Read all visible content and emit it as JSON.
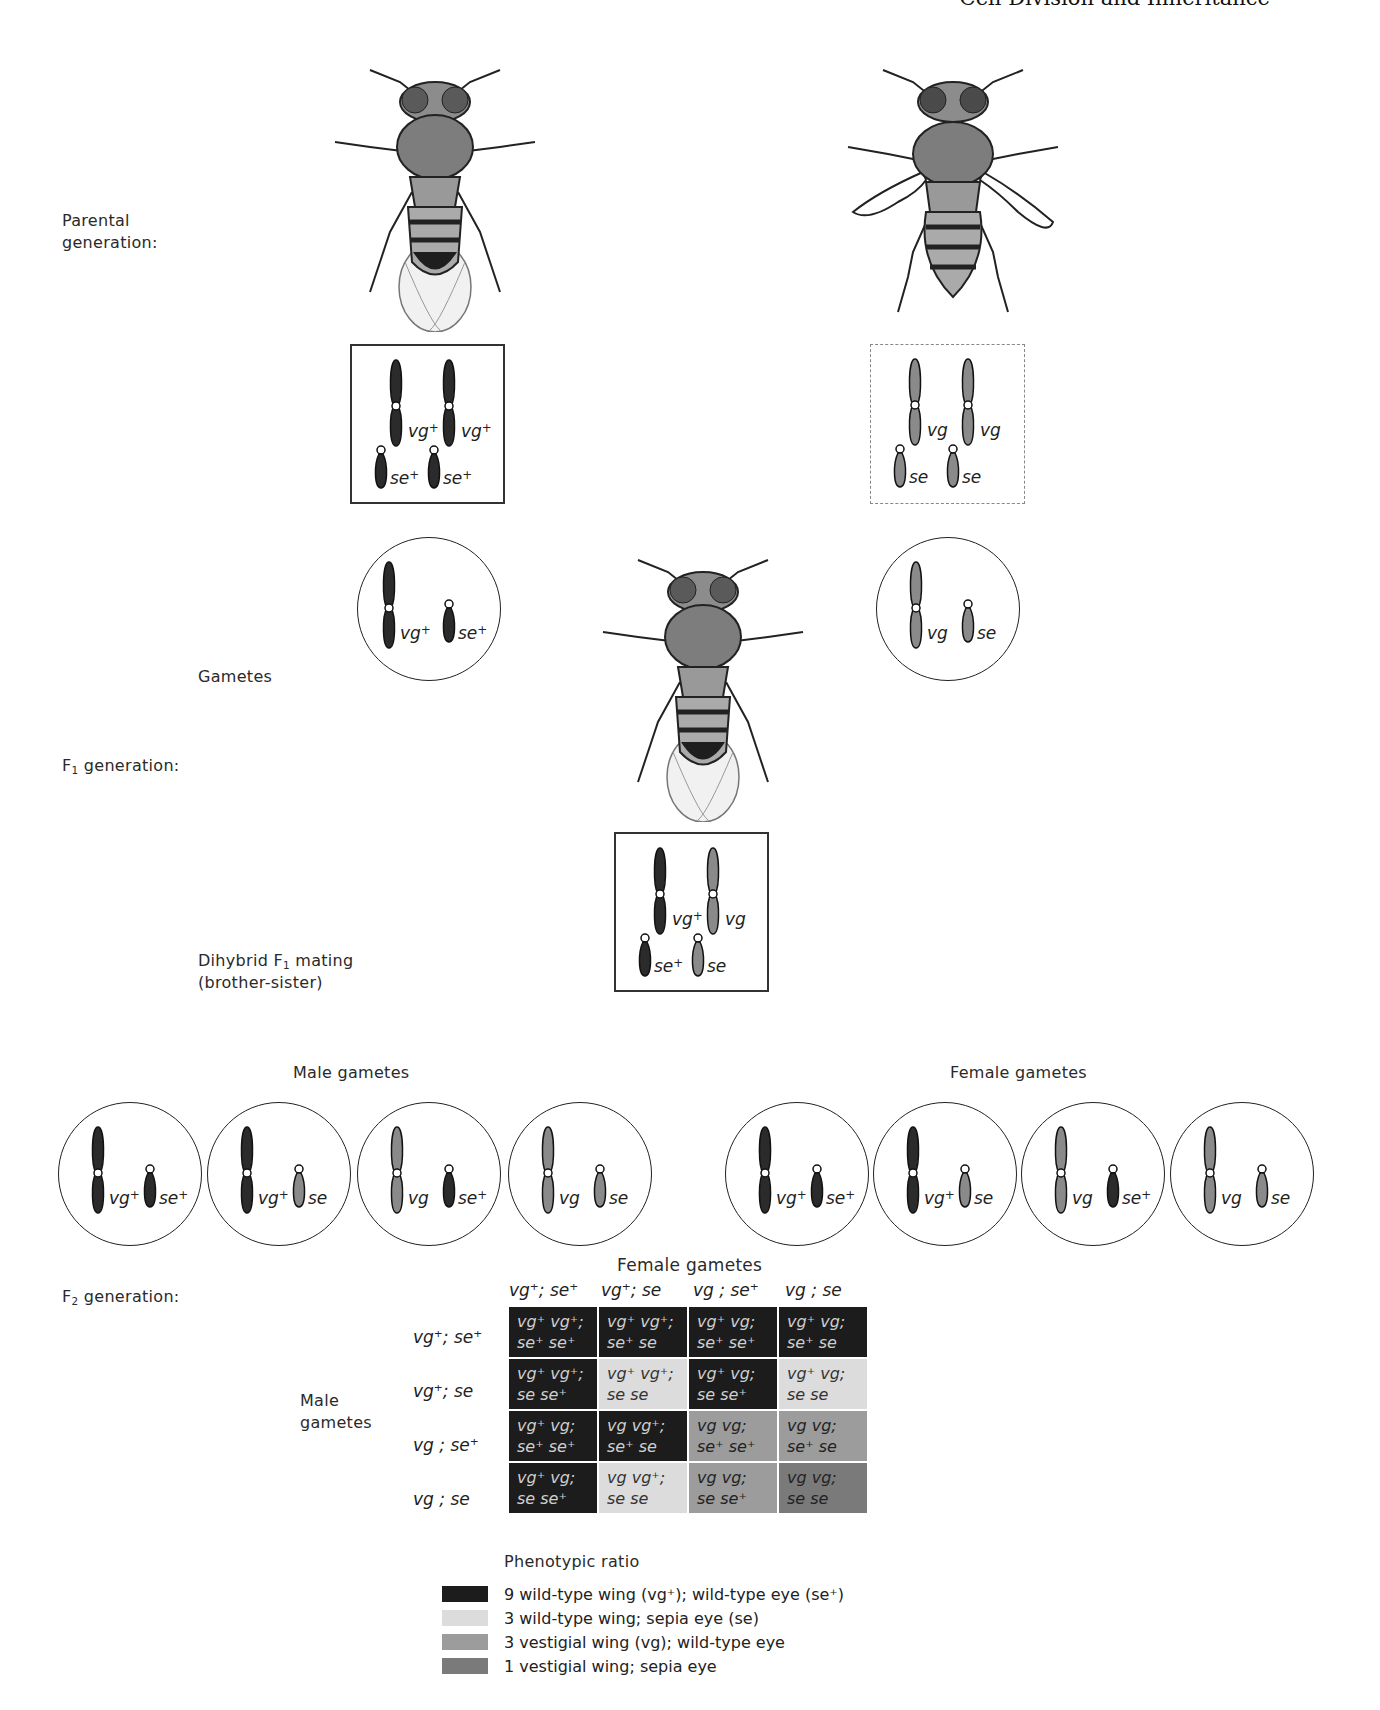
{
  "header": {
    "title": "Cell Division and Inheritance"
  },
  "labels": {
    "parental_generation_line1": "Parental",
    "parental_generation_line2": "generation:",
    "gametes": "Gametes",
    "f1_generation": "generation:",
    "f1_prefix": "F",
    "f1_sub": "1",
    "dihybrid_line1_prefix": "Dihybrid F",
    "dihybrid_sub": "1",
    "dihybrid_line1_suffix": " mating",
    "dihybrid_line2": "(brother-sister)",
    "male_gametes": "Male gametes",
    "female_gametes": "Female gametes",
    "f2_prefix": "F",
    "f2_sub": "2",
    "f2_generation": "generation:",
    "punnett_female_header": "Female gametes",
    "punnett_male_header_line1": "Male",
    "punnett_male_header_line2": "gametes"
  },
  "parents": {
    "left": {
      "fly": "wild-type fly (normal wings)",
      "genotype": {
        "a1": "vg",
        "a1_sup": "+",
        "a2": "vg",
        "a2_sup": "+",
        "b1": "se",
        "b1_sup": "+",
        "b2": "se",
        "b2_sup": "+"
      },
      "gamete": {
        "a": "vg",
        "a_sup": "+",
        "b": "se",
        "b_sup": "+"
      }
    },
    "right": {
      "fly": "vestigial-wing sepia-eye fly",
      "genotype": {
        "a1": "vg",
        "a1_sup": "",
        "a2": "vg",
        "a2_sup": "",
        "b1": "se",
        "b1_sup": "",
        "b2": "se",
        "b2_sup": ""
      },
      "gamete": {
        "a": "vg",
        "a_sup": "",
        "b": "se",
        "b_sup": ""
      }
    }
  },
  "f1": {
    "fly": "F1 wild-type phenotype fly",
    "genotype": {
      "a1": "vg",
      "a1_sup": "+",
      "a2": "vg",
      "a2_sup": "",
      "b1": "se",
      "b1_sup": "+",
      "b2": "se",
      "b2_sup": ""
    }
  },
  "male_gametes": [
    {
      "a": "vg",
      "a_sup": "+",
      "b": "se",
      "b_sup": "+"
    },
    {
      "a": "vg",
      "a_sup": "+",
      "b": "se",
      "b_sup": ""
    },
    {
      "a": "vg",
      "a_sup": "",
      "b": "se",
      "b_sup": "+"
    },
    {
      "a": "vg",
      "a_sup": "",
      "b": "se",
      "b_sup": ""
    }
  ],
  "female_gametes": [
    {
      "a": "vg",
      "a_sup": "+",
      "b": "se",
      "b_sup": "+"
    },
    {
      "a": "vg",
      "a_sup": "+",
      "b": "se",
      "b_sup": ""
    },
    {
      "a": "vg",
      "a_sup": "",
      "b": "se",
      "b_sup": "+"
    },
    {
      "a": "vg",
      "a_sup": "",
      "b": "se",
      "b_sup": ""
    }
  ],
  "punnett": {
    "columns": [
      "vg⁺; se⁺",
      "vg⁺; se",
      "vg ; se⁺",
      "vg ; se"
    ],
    "rows": [
      "vg⁺; se⁺",
      "vg⁺; se",
      "vg ;  se⁺",
      "vg ; se"
    ],
    "cells": [
      [
        {
          "l1": "vg⁺ vg⁺;",
          "l2": "se⁺ se⁺",
          "phen": 1
        },
        {
          "l1": "vg⁺ vg⁺;",
          "l2": "se⁺ se",
          "phen": 1
        },
        {
          "l1": "vg⁺ vg;",
          "l2": "se⁺ se⁺",
          "phen": 1
        },
        {
          "l1": "vg⁺ vg;",
          "l2": "se⁺ se",
          "phen": 1
        }
      ],
      [
        {
          "l1": "vg⁺ vg⁺;",
          "l2": "se se⁺",
          "phen": 1
        },
        {
          "l1": "vg⁺ vg⁺;",
          "l2": "se se",
          "phen": 2
        },
        {
          "l1": "vg⁺ vg;",
          "l2": "se se⁺",
          "phen": 1
        },
        {
          "l1": "vg⁺ vg;",
          "l2": "se se",
          "phen": 2
        }
      ],
      [
        {
          "l1": "vg⁺ vg;",
          "l2": "se⁺ se⁺",
          "phen": 1
        },
        {
          "l1": "vg vg⁺;",
          "l2": "se⁺ se",
          "phen": 1
        },
        {
          "l1": "vg vg;",
          "l2": "se⁺ se⁺",
          "phen": 3
        },
        {
          "l1": "vg vg;",
          "l2": "se⁺ se",
          "phen": 3
        }
      ],
      [
        {
          "l1": "vg⁺ vg;",
          "l2": "se se⁺",
          "phen": 1
        },
        {
          "l1": "vg vg⁺;",
          "l2": "se se",
          "phen": 2
        },
        {
          "l1": "vg vg;",
          "l2": "se se⁺",
          "phen": 3
        },
        {
          "l1": "vg vg;",
          "l2": "se se",
          "phen": 4
        }
      ]
    ]
  },
  "legend": {
    "title": "Phenotypic ratio",
    "items": [
      {
        "color": "#1c1c1c",
        "text": "9 wild-type wing (vg⁺); wild-type eye (se⁺)"
      },
      {
        "color": "#dcdcdc",
        "text": "3 wild-type wing; sepia eye (se)"
      },
      {
        "color": "#9c9c9c",
        "text": "3 vestigial wing (vg); wild-type eye"
      },
      {
        "color": "#7a7a7a",
        "text": "1 vestigial wing; sepia eye"
      }
    ]
  },
  "colors": {
    "dominant_chrom": "#2b2b2b",
    "recessive_chrom": "#8a8a8a"
  }
}
